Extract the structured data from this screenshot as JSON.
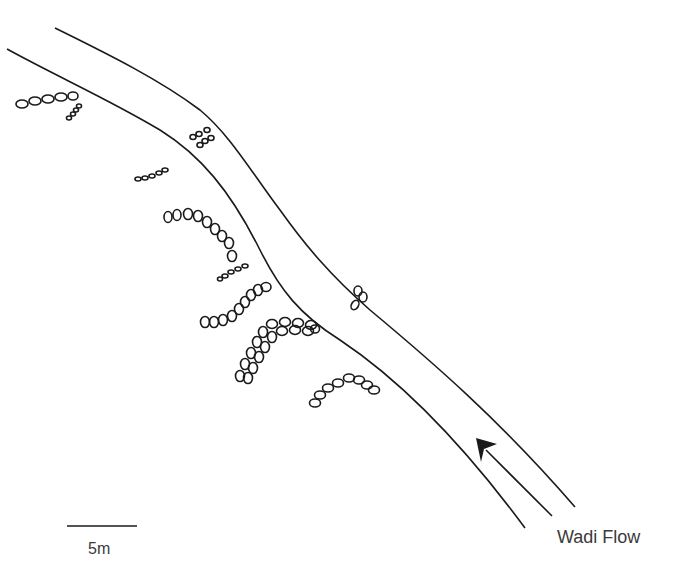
{
  "diagram": {
    "flow_label": "Wadi Flow",
    "scale": {
      "label": "5m",
      "bar_length_px": 70
    },
    "colors": {
      "line": "#1a1a1a",
      "text": "#3a3a3a",
      "background": "#ffffff"
    },
    "channel": {
      "banks": [
        "west-bank",
        "east-bank"
      ]
    },
    "stone_features": [
      {
        "id": "feature-1",
        "description": "line of 5 stones off west bank with small stone spur"
      },
      {
        "id": "feature-2",
        "description": "small stone cluster on east bank"
      },
      {
        "id": "feature-3",
        "description": "line of small stones off west bank"
      },
      {
        "id": "feature-4",
        "description": "curving line of stones along west bank"
      },
      {
        "id": "feature-5",
        "description": "line of small stones"
      },
      {
        "id": "feature-6",
        "description": "curved line of stones"
      },
      {
        "id": "feature-7",
        "description": "double row of stones forming an arc"
      },
      {
        "id": "feature-8",
        "description": "stone cluster on east bank"
      },
      {
        "id": "feature-9",
        "description": "arc of stones"
      }
    ]
  }
}
